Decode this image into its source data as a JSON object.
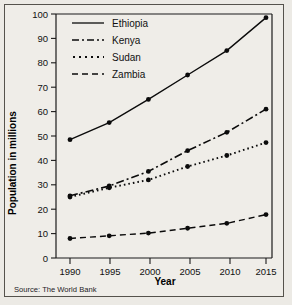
{
  "chart_data": {
    "type": "line",
    "title": "",
    "xlabel": "Year",
    "ylabel": "Population in millions",
    "x": [
      1990,
      1995,
      2000,
      2005,
      2010,
      2015
    ],
    "xticklabels": [
      "1990",
      "1995",
      "2000",
      "2005",
      "2010",
      "2015"
    ],
    "yticklabels": [
      "0",
      "10",
      "20",
      "30",
      "40",
      "50",
      "60",
      "70",
      "80",
      "90",
      "100"
    ],
    "xlim": [
      1988.5,
      2016.5
    ],
    "ylim": [
      0,
      100
    ],
    "ytick_step": 10,
    "grid": false,
    "legend_position": "top-left inside plot",
    "marker": "filled-circle",
    "series": [
      {
        "name": "Ethiopia",
        "style": "solid",
        "dash": "none",
        "values": [
          48.5,
          55.5,
          65.0,
          75.0,
          85.0,
          98.5
        ]
      },
      {
        "name": "Kenya",
        "style": "dash-dot",
        "dash": "8,3,2,3",
        "values": [
          25.5,
          29.5,
          35.5,
          44.0,
          51.5,
          61.0
        ]
      },
      {
        "name": "Sudan",
        "style": "dotted",
        "dash": "1.6,3",
        "values": [
          25.0,
          28.8,
          32.0,
          37.5,
          42.0,
          47.3
        ]
      },
      {
        "name": "Zambia",
        "style": "dashed",
        "dash": "6,4",
        "values": [
          8.0,
          9.1,
          10.2,
          12.2,
          14.2,
          17.8
        ]
      }
    ],
    "source": "Source: The World Bank"
  },
  "legend": {
    "items": [
      {
        "label": "Ethiopia"
      },
      {
        "label": "Kenya"
      },
      {
        "label": "Sudan"
      },
      {
        "label": "Zambia"
      }
    ]
  },
  "colors": {
    "ink": "#0b0b0b",
    "paper": "#efedE8",
    "frame": "#55524c"
  }
}
